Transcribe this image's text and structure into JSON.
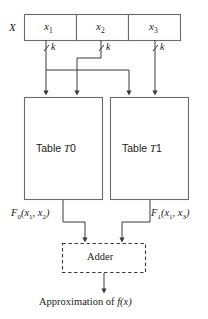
{
  "figure": {
    "type": "block-diagram",
    "background_color": "#ffffff",
    "line_color": "#3a3a3a",
    "box_border_color": "#6b6b6b",
    "text_color": "#1b1b1b"
  },
  "input_register": {
    "name_label": "X",
    "cells": [
      {
        "id": "x1",
        "base": "x",
        "sub": "1"
      },
      {
        "id": "x2",
        "base": "x",
        "sub": "2"
      },
      {
        "id": "x3",
        "base": "x",
        "sub": "3"
      }
    ]
  },
  "bus_taps": [
    {
      "id": "tap-x1",
      "label": "k"
    },
    {
      "id": "tap-x2",
      "label": "k"
    },
    {
      "id": "tap-x3",
      "label": "k"
    }
  ],
  "tables": [
    {
      "id": "t0",
      "prefix": "Table ",
      "symbol": "T",
      "index": "0",
      "inputs": [
        "x1",
        "x2"
      ]
    },
    {
      "id": "t1",
      "prefix": "Table ",
      "symbol": "T",
      "index": "1",
      "inputs": [
        "x1",
        "x3"
      ]
    }
  ],
  "outputs": [
    {
      "id": "f0",
      "base": "F",
      "sub": "0",
      "args_open": "(",
      "arg1_base": "x",
      "arg1_sub": "1",
      "separator": ", ",
      "arg2_base": "x",
      "arg2_sub": "2",
      "args_close": ")"
    },
    {
      "id": "f1",
      "base": "F",
      "sub": "1",
      "args_open": "(",
      "arg1_base": "x",
      "arg1_sub": "1",
      "separator": ", ",
      "arg2_base": "x",
      "arg2_sub": "3",
      "args_close": ")"
    }
  ],
  "adder": {
    "label": "Adder",
    "style": "dashed"
  },
  "result": {
    "prefix": "Approximation of ",
    "function": "f",
    "args": "(x)"
  }
}
